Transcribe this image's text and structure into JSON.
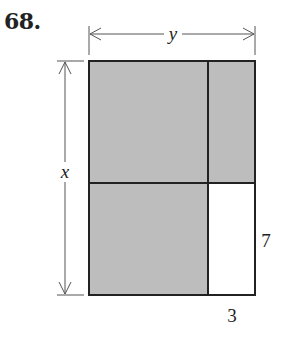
{
  "problem_number": "68.",
  "diagram": {
    "type": "area model rectangle",
    "dimension_labels": {
      "width": "y",
      "height": "x",
      "small_width": "3",
      "small_height": "7"
    },
    "regions": [
      {
        "name": "top-left",
        "shaded": true
      },
      {
        "name": "top-right",
        "shaded": true
      },
      {
        "name": "bottom-left",
        "shaded": true
      },
      {
        "name": "bottom-right",
        "shaded": false,
        "size": "3 by 7"
      }
    ],
    "colors": {
      "shaded": "#bdbdbd",
      "unshaded": "#ffffff",
      "stroke": "#222222"
    }
  }
}
